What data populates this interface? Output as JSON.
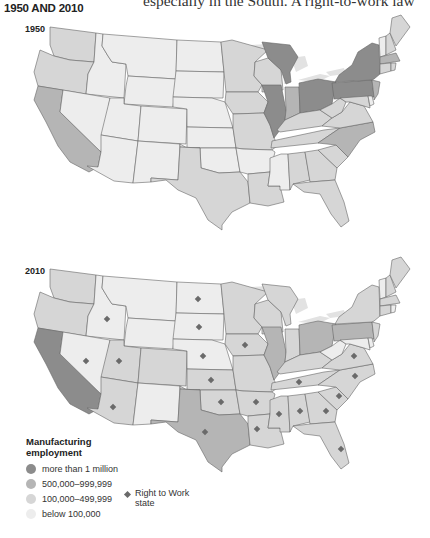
{
  "heading": "1950 AND 2010",
  "body_text": "especially in the South. A right-to-work law",
  "maps": [
    {
      "year_label": "1950"
    },
    {
      "year_label": "2010"
    }
  ],
  "legend": {
    "title_line1": "Manufacturing",
    "title_line2": "employment",
    "items": [
      {
        "label": "more than 1 million",
        "color": "#8c8c8c"
      },
      {
        "label": "500,000–999,999",
        "color": "#b5b5b5"
      },
      {
        "label": "100,000–499,999",
        "color": "#d6d6d6"
      },
      {
        "label": "below 100,000",
        "color": "#ededed"
      }
    ],
    "rtw_label_line1": "Right to Work",
    "rtw_label_line2": "state"
  },
  "colors": {
    "c1": "#8c8c8c",
    "c2": "#b5b5b5",
    "c3": "#d6d6d6",
    "c4": "#ededed",
    "lake": "#e2e2e2",
    "marker": "#6a6a6a"
  },
  "map_data": {
    "1950": {
      "more_than_1_million": [
        "IL",
        "MI",
        "OH",
        "PA",
        "NY"
      ],
      "500000_999999": [
        "CA",
        "IN",
        "NJ",
        "NC",
        "MA"
      ],
      "100000_499999": [
        "WA",
        "OR",
        "TX",
        "MN",
        "WI",
        "IA",
        "MO",
        "KY",
        "TN",
        "VA",
        "WV",
        "MD",
        "AL",
        "GA",
        "SC",
        "FL",
        "LA",
        "CT",
        "NH",
        "ME",
        "RI"
      ],
      "below_100000": [
        "ID",
        "MT",
        "WY",
        "NV",
        "UT",
        "CO",
        "AZ",
        "NM",
        "ND",
        "SD",
        "NE",
        "KS",
        "OK",
        "AR",
        "MS",
        "VT",
        "DE"
      ]
    },
    "2010": {
      "more_than_1_million": [
        "CA"
      ],
      "500000_999999": [
        "TX",
        "IL",
        "OH",
        "PA"
      ],
      "100000_499999": [
        "WA",
        "OR",
        "UT",
        "AZ",
        "CO",
        "KS",
        "OK",
        "MN",
        "WI",
        "IA",
        "MO",
        "AR",
        "LA",
        "MS",
        "AL",
        "GA",
        "FL",
        "SC",
        "NC",
        "VA",
        "TN",
        "KY",
        "IN",
        "MI",
        "NY",
        "NJ",
        "MA",
        "CT",
        "NH",
        "ME"
      ],
      "below_100000": [
        "ID",
        "MT",
        "WY",
        "NV",
        "NM",
        "ND",
        "SD",
        "NE",
        "WV",
        "VT",
        "DE",
        "RI",
        "MD"
      ],
      "right_to_work": [
        "ID",
        "NV",
        "UT",
        "AZ",
        "ND",
        "SD",
        "NE",
        "KS",
        "OK",
        "TX",
        "IA",
        "AR",
        "LA",
        "MS",
        "AL",
        "GA",
        "FL",
        "SC",
        "NC",
        "VA",
        "TN",
        "WY"
      ]
    }
  }
}
